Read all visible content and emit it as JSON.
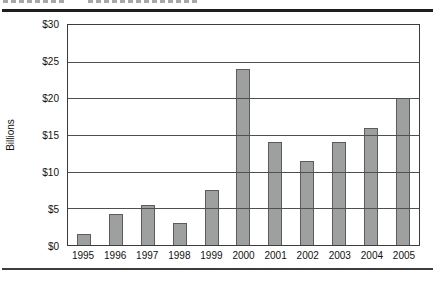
{
  "page": {
    "background": "#ffffff",
    "top_rule_color": "#1e1e1e",
    "bottom_rule_color": "#3d3d3d"
  },
  "chart_data": {
    "type": "bar",
    "title": "",
    "xlabel": "",
    "ylabel": "Billions",
    "categories": [
      "1995",
      "1996",
      "1997",
      "1998",
      "1999",
      "2000",
      "2001",
      "2002",
      "2003",
      "2004",
      "2005"
    ],
    "values": [
      1.5,
      4.2,
      5.5,
      3,
      7.5,
      24,
      14,
      11.5,
      14,
      16,
      20
    ],
    "y_ticks": [
      "$30",
      "$25",
      "$20",
      "$15",
      "$10",
      "$5",
      "$0"
    ],
    "y_tick_values": [
      30,
      25,
      20,
      15,
      10,
      5,
      0
    ],
    "ylim": [
      0,
      30
    ],
    "grid": "horizontal",
    "legend": "none",
    "bar_fill": "#9e9f9f",
    "bar_border": "#5c5c5c",
    "gridline_color": "#4f4f4f"
  }
}
